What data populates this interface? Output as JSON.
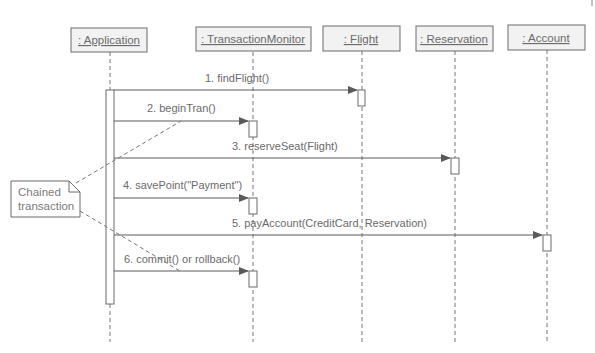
{
  "diagram": {
    "type": "uml-sequence",
    "colors": {
      "line": "#6a6a6a",
      "box_fill": "#f2f2f2",
      "activation_fill": "#ffffff",
      "text": "#6a6a6a"
    },
    "lifelines": [
      {
        "id": "application",
        "label": ": Application",
        "x": 110
      },
      {
        "id": "transaction-monitor",
        "label": ": TransactionMonitor",
        "x": 253
      },
      {
        "id": "flight",
        "label": ": Flight",
        "x": 362
      },
      {
        "id": "reservation",
        "label": ": Reservation",
        "x": 455
      },
      {
        "id": "account",
        "label": ": Account",
        "x": 547
      }
    ],
    "messages": [
      {
        "n": 1,
        "label": "1. findFlight()",
        "from": "application",
        "to": "flight",
        "y": 90
      },
      {
        "n": 2,
        "label": "2. beginTran()",
        "from": "application",
        "to": "transaction-monitor",
        "y": 121
      },
      {
        "n": 3,
        "label": "3. reserveSeat(Flight)",
        "from": "application",
        "to": "reservation",
        "y": 158
      },
      {
        "n": 4,
        "label": "4. savePoint(\"Payment\")",
        "from": "application",
        "to": "transaction-monitor",
        "y": 198
      },
      {
        "n": 5,
        "label": "5. payAccount(CreditCard, Reservation)",
        "from": "application",
        "to": "account",
        "y": 235
      },
      {
        "n": 6,
        "label": "6. commit() or rollback()",
        "from": "application",
        "to": "transaction-monitor",
        "y": 271
      }
    ],
    "note": {
      "line1": "Chained",
      "line2": "transaction"
    }
  }
}
